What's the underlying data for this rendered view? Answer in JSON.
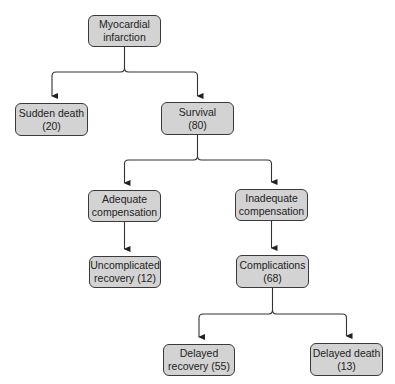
{
  "diagram": {
    "type": "flowchart",
    "title": "",
    "colors": {
      "node_fill": "#d3d3d3",
      "node_border": "#3a3a3a",
      "edge": "#333333",
      "text": "#222222"
    },
    "nodes": {
      "mi": {
        "line1": "Myocardial",
        "line2": "infarction"
      },
      "sudden": {
        "line1": "Sudden death",
        "line2": "(20)"
      },
      "survival": {
        "line1": "Survival",
        "line2": "(80)"
      },
      "adequate": {
        "line1": "Adequate",
        "line2": "compensation"
      },
      "inadequate": {
        "line1": "Inadequate",
        "line2": "compensation"
      },
      "uncomplicated": {
        "line1": "Uncomplicated",
        "line2": "recovery (12)"
      },
      "complications": {
        "line1": "Complications",
        "line2": "(68)"
      },
      "delayed_recovery": {
        "line1": "Delayed",
        "line2": "recovery (55)"
      },
      "delayed_death": {
        "line1": "Delayed death",
        "line2": "(13)"
      }
    },
    "edges": [
      {
        "from": "Myocardial infarction",
        "to": "Sudden death (20)"
      },
      {
        "from": "Myocardial infarction",
        "to": "Survival (80)"
      },
      {
        "from": "Survival (80)",
        "to": "Adequate compensation"
      },
      {
        "from": "Survival (80)",
        "to": "Inadequate compensation"
      },
      {
        "from": "Adequate compensation",
        "to": "Uncomplicated recovery (12)"
      },
      {
        "from": "Inadequate compensation",
        "to": "Complications (68)"
      },
      {
        "from": "Complications (68)",
        "to": "Delayed recovery (55)"
      },
      {
        "from": "Complications (68)",
        "to": "Delayed death (13)"
      }
    ]
  }
}
